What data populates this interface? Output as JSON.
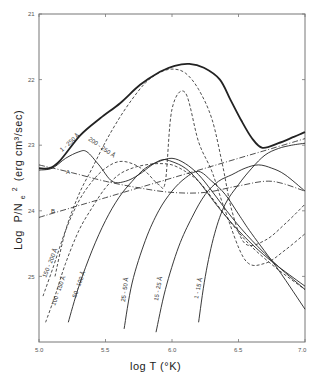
{
  "chart_data": {
    "type": "line",
    "title": "",
    "xlabel": "log T (°K)",
    "ylabel": "Log P/Nₑ² (erg cm³/sec)",
    "xlim": [
      5.0,
      7.0
    ],
    "ylim": [
      -26,
      -21
    ],
    "y_inverted_labels": true,
    "x_ticks": [
      "5.0",
      "5.5",
      "6.0",
      "6.5",
      "7.0"
    ],
    "y_ticks": [
      "21",
      "22",
      "23",
      "24",
      "25"
    ],
    "grid": false,
    "legend": "inline curve labels",
    "series": [
      {
        "name": "1 - 250 Å",
        "style": "solid-thick",
        "x": [
          5.0,
          5.08,
          5.16,
          5.31,
          5.46,
          5.61,
          5.76,
          5.91,
          6.02,
          6.13,
          6.24,
          6.36,
          6.44,
          6.52,
          6.6,
          6.68,
          6.8,
          6.92,
          7.0
        ],
        "y": [
          -23.35,
          -23.35,
          -23.23,
          -22.85,
          -22.59,
          -22.36,
          -22.08,
          -21.88,
          -21.79,
          -21.76,
          -21.82,
          -22.0,
          -22.31,
          -22.62,
          -22.89,
          -23.04,
          -22.97,
          -22.87,
          -22.8
        ]
      },
      {
        "name": "200 - 250 Å",
        "style": "solid",
        "x": [
          5.0,
          5.1,
          5.2,
          5.3,
          5.36,
          5.45,
          5.55,
          5.65,
          5.75,
          5.85,
          5.93,
          6.0,
          6.1,
          6.2,
          6.35,
          6.5,
          6.65,
          6.8,
          7.0
        ],
        "y": [
          -23.38,
          -23.35,
          -23.2,
          -23.1,
          -23.1,
          -23.3,
          -23.55,
          -23.55,
          -23.45,
          -23.3,
          -23.22,
          -23.25,
          -23.35,
          -23.55,
          -23.95,
          -24.3,
          -24.6,
          -24.85,
          -25.15
        ]
      },
      {
        "name": "A",
        "style": "dash-dot",
        "x": [
          5.0,
          5.25,
          5.5,
          5.75,
          6.0,
          6.25,
          6.5,
          6.75,
          7.0
        ],
        "y": [
          -23.3,
          -23.42,
          -23.55,
          -23.65,
          -23.72,
          -23.72,
          -23.62,
          -23.55,
          -23.7
        ]
      },
      {
        "name": "B",
        "style": "dash-dot",
        "x": [
          5.0,
          5.25,
          5.5,
          5.75,
          6.0,
          6.25,
          6.5,
          6.75,
          7.0
        ],
        "y": [
          -24.1,
          -23.95,
          -23.8,
          -23.65,
          -23.5,
          -23.35,
          -23.2,
          -23.05,
          -22.9
        ]
      },
      {
        "name": "150 - 200 Å",
        "style": "dashed",
        "x": [
          5.03,
          5.1,
          5.2,
          5.3,
          5.4,
          5.5,
          5.6,
          5.7,
          5.8,
          5.9,
          5.95,
          6.0,
          6.1,
          6.2,
          6.3,
          6.4,
          6.55,
          6.7,
          6.85,
          7.0
        ],
        "y": [
          -25.3,
          -24.9,
          -24.3,
          -23.85,
          -23.55,
          -23.35,
          -23.25,
          -23.28,
          -23.4,
          -23.6,
          -23.55,
          -22.45,
          -22.2,
          -22.95,
          -23.4,
          -24.0,
          -24.75,
          -24.8,
          -24.6,
          -24.35
        ]
      },
      {
        "name": "100 - 150 Å",
        "style": "dashed",
        "x": [
          5.05,
          5.12,
          5.2,
          5.3,
          5.4,
          5.5,
          5.6,
          5.7,
          5.8,
          5.9,
          6.0,
          6.1,
          6.2,
          6.3,
          6.45,
          6.6,
          6.8,
          7.0
        ],
        "y": [
          -25.7,
          -25.3,
          -24.8,
          -24.3,
          -23.95,
          -23.65,
          -23.45,
          -23.35,
          -23.3,
          -23.28,
          -23.3,
          -23.4,
          -23.55,
          -23.8,
          -24.2,
          -24.55,
          -24.9,
          -25.2
        ]
      },
      {
        "name": "50 - 100 Å",
        "style": "solid",
        "x": [
          5.22,
          5.3,
          5.4,
          5.5,
          5.6,
          5.7,
          5.8,
          5.9,
          6.0,
          6.1,
          6.2,
          6.3,
          6.45,
          6.6,
          6.8,
          7.0
        ],
        "y": [
          -25.7,
          -25.15,
          -24.6,
          -24.15,
          -23.8,
          -23.55,
          -23.35,
          -23.25,
          -23.2,
          -23.28,
          -23.45,
          -23.7,
          -24.1,
          -24.45,
          -24.85,
          -25.2
        ]
      },
      {
        "name": "25 - 50 Å",
        "style": "solid",
        "x": [
          5.64,
          5.7,
          5.8,
          5.9,
          6.0,
          6.1,
          6.2,
          6.3,
          6.4,
          6.5,
          6.6,
          6.8,
          7.0
        ],
        "y": [
          -25.8,
          -25.1,
          -24.45,
          -24.0,
          -23.7,
          -23.5,
          -23.4,
          -23.55,
          -23.75,
          -24.05,
          -24.35,
          -24.9,
          -25.5
        ]
      },
      {
        "name": "15 - 25 Å",
        "style": "solid",
        "x": [
          5.88,
          5.95,
          6.05,
          6.15,
          6.25,
          6.35,
          6.45,
          6.55,
          6.65,
          6.75,
          6.85,
          7.0
        ],
        "y": [
          -25.85,
          -25.2,
          -24.55,
          -24.1,
          -23.75,
          -23.55,
          -23.45,
          -23.35,
          -23.3,
          -23.35,
          -23.45,
          -23.7
        ]
      },
      {
        "name": "1 - 15 Å",
        "style": "solid",
        "x": [
          6.2,
          6.25,
          6.32,
          6.4,
          6.5,
          6.6,
          6.7,
          6.8,
          6.9,
          7.0
        ],
        "y": [
          -25.7,
          -25.0,
          -24.35,
          -23.9,
          -23.6,
          -23.35,
          -23.15,
          -23.05,
          -23.0,
          -22.97
        ]
      },
      {
        "name": "dashed envelope",
        "style": "dashed",
        "x": [
          5.12,
          5.2,
          5.3,
          5.4,
          5.5,
          5.6,
          5.7,
          5.8,
          5.9,
          6.0,
          6.1,
          6.2,
          6.3,
          6.38,
          6.45,
          6.55,
          6.7,
          6.85,
          7.0
        ],
        "y": [
          -25.0,
          -24.3,
          -23.75,
          -23.35,
          -22.95,
          -22.6,
          -22.3,
          -22.05,
          -21.9,
          -21.84,
          -21.9,
          -22.15,
          -22.6,
          -23.3,
          -24.0,
          -24.5,
          -24.45,
          -24.2,
          -23.9
        ]
      }
    ]
  },
  "labels": {
    "x_axis_title": "log T (°K)",
    "y_axis_title_log": "Log",
    "y_axis_title_ratio": "P/N",
    "y_axis_title_sub": "e",
    "y_axis_title_sup": "2",
    "y_axis_title_units": "(erg cm³/sec)",
    "curve_1_250": "1 - 250 Å",
    "curve_200_250": "200 - 250 Å",
    "curve_A": "A",
    "curve_B": "B",
    "curve_150_200": "150 - 200 Å",
    "curve_100_150": "100 - 150 Å",
    "curve_50_100": "50 - 100 Å",
    "curve_25_50": "25 - 50 Å",
    "curve_15_25": "15 - 25 Å",
    "curve_1_15": "1 - 15 Å"
  }
}
